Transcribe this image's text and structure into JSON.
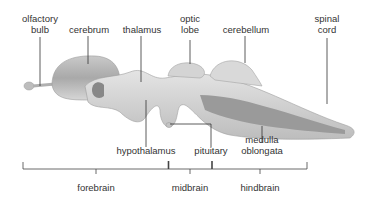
{
  "diagram": {
    "structure_labels": [
      {
        "id": "olfactory-bulb",
        "text": "olfactory\nbulb"
      },
      {
        "id": "cerebrum",
        "text": "cerebrum"
      },
      {
        "id": "thalamus",
        "text": "thalamus"
      },
      {
        "id": "optic-lobe",
        "text": "optic\nlobe"
      },
      {
        "id": "cerebellum",
        "text": "cerebellum"
      },
      {
        "id": "spinal-cord",
        "text": "spinal\ncord"
      },
      {
        "id": "hypothalamus",
        "text": "hypothalamus"
      },
      {
        "id": "pituitary",
        "text": "pituitary"
      },
      {
        "id": "medulla-oblongata",
        "text": "medulla\noblongata"
      }
    ],
    "region_labels": [
      {
        "id": "forebrain",
        "text": "forebrain"
      },
      {
        "id": "midbrain",
        "text": "midbrain"
      },
      {
        "id": "hindbrain",
        "text": "hindbrain"
      }
    ]
  }
}
